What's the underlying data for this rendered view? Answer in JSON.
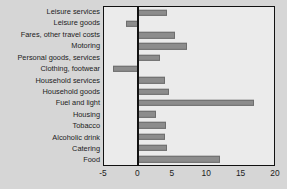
{
  "chart_data": {
    "type": "bar",
    "orientation": "horizontal",
    "title": "",
    "xlabel": "",
    "ylabel": "",
    "xlim": [
      -5,
      20
    ],
    "xticks": [
      -5,
      0,
      5,
      10,
      15,
      20
    ],
    "xtick_labels": [
      "-5",
      "0",
      "5",
      "10",
      "15",
      "20"
    ],
    "grid": false,
    "legend": null,
    "zero_line": 0,
    "bar_color": "#8c8c8c",
    "bar_edge_color": "#6e6e6e",
    "plot_background": "#ebebeb",
    "figure_background": "#d6d6d6",
    "axis_color": "#111111",
    "categories": [
      "Leisure services",
      "Leisure goods",
      "Fares, other travel costs",
      "Motoring",
      "Personal goods, services",
      "Clothing, footwear",
      "Household services",
      "Household goods",
      "Fuel and light",
      "Housing",
      "Tobacco",
      "Alcoholic drink",
      "Catering",
      "Food"
    ],
    "values": [
      4.2,
      -1.8,
      5.4,
      7.2,
      3.3,
      -3.7,
      4.0,
      4.5,
      17.0,
      2.7,
      4.1,
      3.9,
      4.3,
      12.1
    ]
  }
}
